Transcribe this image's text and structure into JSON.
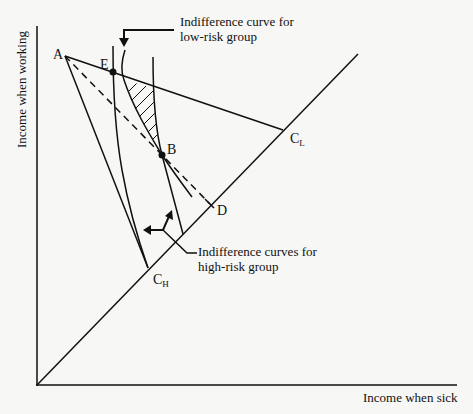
{
  "diagram": {
    "axes": {
      "x_label": "Income when sick",
      "y_label": "Income when working"
    },
    "points": {
      "A": "A",
      "E": "E",
      "B": "B",
      "D": "D",
      "C_L_main": "C",
      "C_L_sub": "L",
      "C_H_main": "C",
      "C_H_sub": "H"
    },
    "annotations": {
      "low_risk_line1": "Indifference curve for",
      "low_risk_line2": "low-risk group",
      "high_risk_line1": "Indifference curves for",
      "high_risk_line2": "high-risk group"
    },
    "colors": {
      "ink": "#111111",
      "background": "#f7f7f6"
    }
  }
}
